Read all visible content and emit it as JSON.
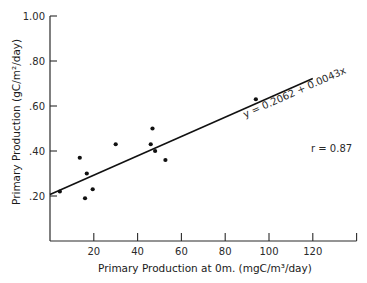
{
  "chart_data": {
    "type": "scatter",
    "title": "",
    "xlabel": "Primary Production at 0m. (mgC/m³/day)",
    "ylabel": "Primary Production   (gC/m²/day)",
    "xlim": [
      0,
      140
    ],
    "ylim": [
      0,
      1.0
    ],
    "x_ticks": [
      20,
      40,
      60,
      80,
      100,
      120,
      140
    ],
    "x_tick_labels": [
      "20",
      "40",
      "60",
      "80",
      "100",
      "120",
      ""
    ],
    "y_ticks": [
      0.2,
      0.4,
      0.6,
      0.8,
      1.0
    ],
    "y_tick_labels": [
      ".20",
      ".40",
      ".60",
      ".80",
      "1.00"
    ],
    "grid": false,
    "legend": null,
    "points": [
      {
        "x": 4.5,
        "y": 0.22
      },
      {
        "x": 13.6,
        "y": 0.37
      },
      {
        "x": 16.0,
        "y": 0.19
      },
      {
        "x": 16.8,
        "y": 0.3
      },
      {
        "x": 19.5,
        "y": 0.23
      },
      {
        "x": 30.0,
        "y": 0.43
      },
      {
        "x": 46.0,
        "y": 0.43
      },
      {
        "x": 46.8,
        "y": 0.5
      },
      {
        "x": 48.0,
        "y": 0.4
      },
      {
        "x": 52.7,
        "y": 0.36
      },
      {
        "x": 94.0,
        "y": 0.63
      }
    ],
    "regression": {
      "intercept": 0.2062,
      "slope": 0.0043,
      "x_range": [
        0,
        120
      ],
      "equation_label": "y = 0.2062 + 0.0043x"
    },
    "annotations": [
      {
        "text": "y = 0.2062 + 0.0043x",
        "position": "along regression line, upper right"
      },
      {
        "text": "r = 0.87",
        "position": "right, middle"
      }
    ]
  },
  "labels": {
    "equation": "y = 0.2062 + 0.0043x",
    "r_value": "r = 0.87",
    "xlabel": "Primary Production at 0m. (mgC/m³/day)",
    "ylabel": "Primary Production   (gC/m²/day)"
  }
}
